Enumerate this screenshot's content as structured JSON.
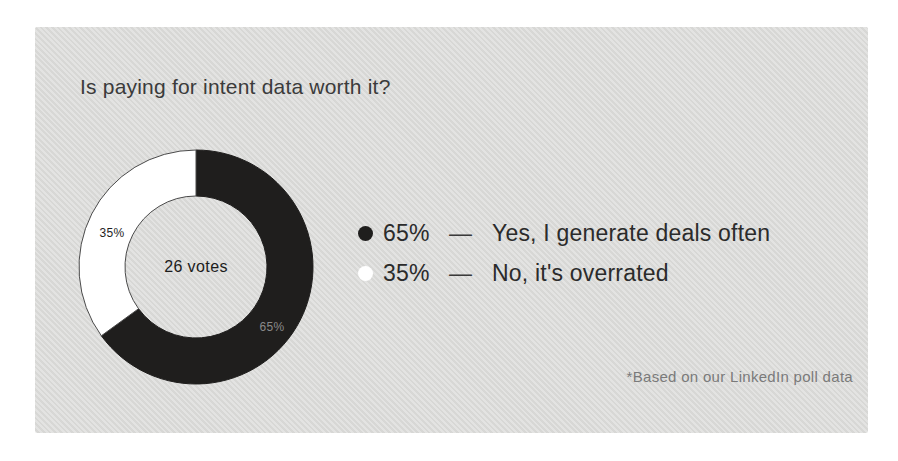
{
  "card": {
    "title": "Is paying for intent data worth it?",
    "footnote": "*Based on our LinkedIn poll data",
    "background_color": "#dadad8"
  },
  "chart_data": {
    "type": "pie",
    "variant": "donut",
    "title": "Is paying for intent data worth it?",
    "center_label": "26 votes",
    "total_votes": 26,
    "start_angle_deg": 0,
    "direction": "clockwise",
    "legend_position": "right",
    "source_note": "*Based on our LinkedIn poll data",
    "slices": [
      {
        "label": "Yes, I generate deals often",
        "value": 65,
        "percent_label": "65%",
        "color": "#1f1e1d",
        "stroke": "#1f1e1d",
        "slice_label_color": "#8a8a8a"
      },
      {
        "label": "No, it's overrated",
        "value": 35,
        "percent_label": "35%",
        "color": "#ffffff",
        "stroke": "#4a4a4a",
        "slice_label_color": "#1e1e1e"
      }
    ]
  },
  "legend": {
    "separator": "—",
    "items": [
      {
        "percent": "65%",
        "dash": "—",
        "label": "Yes, I generate deals often",
        "swatch": "#1f1e1d"
      },
      {
        "percent": "35%",
        "dash": "—",
        "label": "No, it's overrated",
        "swatch": "#ffffff"
      }
    ]
  }
}
